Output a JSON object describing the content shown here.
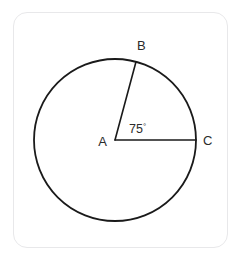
{
  "figure": {
    "type": "geometry-diagram",
    "shape": "circle",
    "stroke_color": "#1a1a1a",
    "label_color": "#2b2b2b",
    "card_border_color": "#e8e8ea",
    "background_color": "#ffffff"
  },
  "circle": {
    "center_label": "A",
    "center_x": 115,
    "center_y": 140,
    "radius": 81,
    "stroke_width": 1.8
  },
  "points": [
    {
      "label": "A",
      "role": "center",
      "x": 115,
      "y": 140,
      "label_x": 107,
      "label_y": 146
    },
    {
      "label": "B",
      "role": "on-circumference",
      "x": 136,
      "y": 62,
      "label_x": 137,
      "label_y": 50
    },
    {
      "label": "C",
      "role": "on-circumference",
      "x": 196,
      "y": 140,
      "label_x": 203,
      "label_y": 145
    }
  ],
  "radii": [
    {
      "name": "AB",
      "from": "A",
      "to": "B"
    },
    {
      "name": "AC",
      "from": "A",
      "to": "C"
    }
  ],
  "angle": {
    "vertex": "A",
    "between": "AB and AC",
    "value": "75",
    "degree_symbol": "°",
    "text": "75°",
    "label_x": 129,
    "label_y": 133
  }
}
